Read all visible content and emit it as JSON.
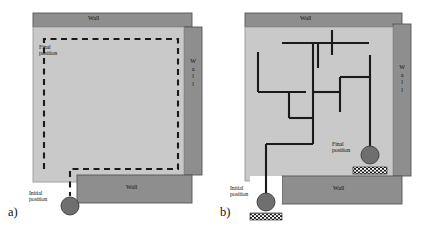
{
  "figure": {
    "type": "diagram",
    "background_color": "#ffffff",
    "panels": [
      {
        "id": "a",
        "label": "a)",
        "label_x": 8,
        "label_y": 208,
        "room": {
          "x": 33,
          "y": 27,
          "width": 151,
          "height": 155,
          "fill": "#c9c9c9",
          "stroke": "#9a9a9a"
        },
        "walls": [
          {
            "name": "wall-top",
            "text": "Wall",
            "orientation": "horizontal",
            "x": 33,
            "y": 13,
            "width": 159,
            "height": 14,
            "fill": "#8e8e8e",
            "stroke": "#555555",
            "text_x": 96,
            "text_y": 17
          },
          {
            "name": "wall-right",
            "text": "Wall",
            "orientation": "vertical",
            "x": 184,
            "y": 27,
            "width": 18,
            "height": 148,
            "fill": "#8e8e8e",
            "stroke": "#555555",
            "text_x": 193,
            "text_y": 72
          },
          {
            "name": "wall-bottom",
            "text": "Wall",
            "orientation": "horizontal",
            "x": 77,
            "y": 175,
            "width": 115,
            "height": 28,
            "fill": "#8e8e8e",
            "stroke": "#555555",
            "text_x": 134,
            "text_y": 186
          }
        ],
        "path": {
          "name": "coverage-path",
          "style": "dashed",
          "color": "#1a1a1a",
          "width": 2.1,
          "dash": "6,4.5",
          "points": "44,169 44,39 178,39 178,169 70,169 70,196"
        },
        "markers": [
          {
            "name": "initial-position-marker",
            "shape": "circle",
            "cx": 70,
            "cy": 206,
            "r": 9,
            "fill": "#6f6f6f",
            "stroke": "#3c3c3c"
          }
        ],
        "labels": [
          {
            "name": "final-position-label",
            "text": "Final\nposition",
            "x": 39,
            "y": 44
          },
          {
            "name": "initial-position-label",
            "text": "Initial\nposition",
            "x": 29,
            "y": 192
          }
        ]
      },
      {
        "id": "b",
        "label": "b)",
        "label_x": 6,
        "label_y": 208,
        "room": {
          "x": 31,
          "y": 27,
          "width": 148,
          "height": 154,
          "fill": "#c9c9c9",
          "stroke": "#9a9a9a"
        },
        "walls": [
          {
            "name": "wall-top",
            "text": "Wall",
            "orientation": "horizontal",
            "x": 31,
            "y": 13,
            "width": 157,
            "height": 14,
            "fill": "#8e8e8e",
            "stroke": "#555555",
            "text_x": 94,
            "text_y": 17
          },
          {
            "name": "wall-right",
            "text": "Wall",
            "orientation": "vertical",
            "x": 179,
            "y": 24,
            "width": 18,
            "height": 152,
            "fill": "#8e8e8e",
            "stroke": "#555555",
            "text_x": 188,
            "text_y": 78
          },
          {
            "name": "wall-bottom",
            "text": "Wall",
            "orientation": "horizontal",
            "x": 68,
            "y": 176,
            "width": 120,
            "height": 28,
            "fill": "#8e8e8e",
            "stroke": "#555555",
            "text_x": 127,
            "text_y": 187
          }
        ],
        "path": {
          "name": "random-walk-path",
          "style": "solid",
          "color": "#1a1a1a",
          "width": 2.1,
          "segments": [
            "68,43 155,43",
            "118,30 118,55",
            "104,43 104,68",
            "44,52 44,92",
            "44,92 92,92",
            "99,43 99,118",
            "75,92 75,118",
            "75,118 99,118",
            "99,92 126,92",
            "126,77 126,92",
            "126,77 156,77",
            "156,55 156,148",
            "126,92 126,112",
            "99,118 99,144",
            "99,144 52,144",
            "52,144 52,196"
          ]
        },
        "markers": [
          {
            "name": "initial-position-marker",
            "shape": "circle",
            "cx": 52,
            "cy": 202,
            "r": 9,
            "fill": "#6f6f6f",
            "stroke": "#3c3c3c"
          },
          {
            "name": "initial-position-hatch",
            "shape": "checkered-rect",
            "x": 36,
            "y": 213,
            "width": 32,
            "height": 7
          },
          {
            "name": "final-position-marker",
            "shape": "circle",
            "cx": 156,
            "cy": 155,
            "r": 9,
            "fill": "#6f6f6f",
            "stroke": "#3c3c3c"
          },
          {
            "name": "final-position-hatch",
            "shape": "checkered-rect",
            "x": 139,
            "y": 167,
            "width": 34,
            "height": 7
          }
        ],
        "labels": [
          {
            "name": "final-position-label",
            "text": "Final\nposition",
            "x": 118,
            "y": 144
          },
          {
            "name": "initial-position-label",
            "text": "Initial\nposition",
            "x": 18,
            "y": 187
          }
        ]
      }
    ]
  },
  "text": {
    "wall": "Wall",
    "wall_vertical_letters": "W\na\nl\nl",
    "final_position": "Final\nposition",
    "initial_position": "Initial\nposition",
    "panel_a_label": "a)",
    "panel_b_label": "b)"
  },
  "colors": {
    "background": "#ffffff",
    "room_fill": "#c9c9c9",
    "room_stroke": "#9a9a9a",
    "wall_fill": "#8e8e8e",
    "wall_stroke": "#555555",
    "path_stroke": "#1a1a1a",
    "marker_fill": "#6f6f6f",
    "marker_stroke": "#3c3c3c",
    "text": "#111111"
  }
}
